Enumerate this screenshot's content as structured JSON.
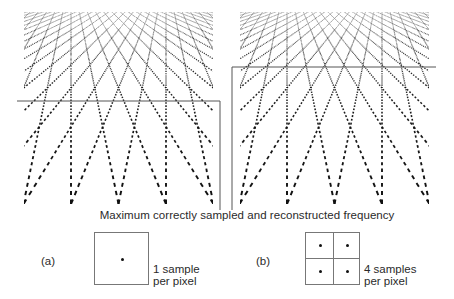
{
  "figure": {
    "caption": "Maximum correctly sampled and reconstructed frequency",
    "panels": [
      {
        "id": "a",
        "label": "(a)",
        "samples_per_pixel": 1,
        "note_line1": "1 sample",
        "note_line2": "per pixel",
        "threshold_line_y": 101
      },
      {
        "id": "b",
        "label": "(b)",
        "samples_per_pixel": 4,
        "note_line1": "4 samples",
        "note_line2": "per pixel",
        "threshold_line_y": 67
      }
    ]
  },
  "colors": {
    "background": "#ffffff",
    "texture": "#111111",
    "guide_line": "#555555",
    "box_border": "#777777",
    "text": "#2a2a2a"
  }
}
